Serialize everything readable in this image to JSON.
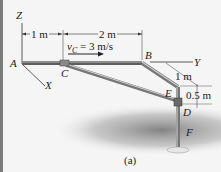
{
  "figure": {
    "caption": "(a)",
    "axes": {
      "z": "Z",
      "x": "X",
      "y": "Y"
    },
    "points": {
      "a": "A",
      "b": "B",
      "c": "C",
      "d": "D",
      "e": "E",
      "f": "F"
    },
    "dimensions": {
      "ac": "1 m",
      "cb": "2 m",
      "b_offset": "1 m",
      "ed": "0.5 m"
    },
    "velocity": {
      "symbol": "v",
      "subscript": "C",
      "value": "= 3 m/s"
    },
    "colors": {
      "background": "#f5f5f5",
      "rod": "#6e6e6e",
      "rod_highlight": "#bdbdbd",
      "shadow": "#8a8a8a",
      "frame": "#7a7a7a"
    }
  }
}
